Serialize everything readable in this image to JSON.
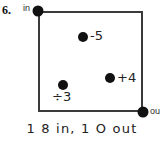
{
  "problem": {
    "number": "6."
  },
  "diagram": {
    "terminals": {
      "input_label": "in",
      "output_label": "ou"
    },
    "operations": [
      {
        "name": "subtract-five",
        "label": "-5"
      },
      {
        "name": "add-four",
        "label": "+4"
      },
      {
        "name": "divide-three",
        "label": "÷3"
      }
    ]
  },
  "caption": {
    "text": "1 8 in, 1 O out"
  },
  "colors": {
    "stroke": "#3a3a3a",
    "node": "#111111",
    "text": "#222222",
    "background": "#ffffff"
  }
}
